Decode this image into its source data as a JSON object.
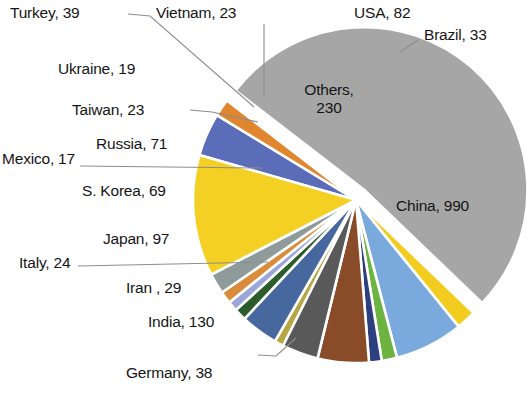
{
  "chart_data": {
    "type": "pie",
    "title": "",
    "subtitle": "",
    "xlabel": "",
    "ylabel": "",
    "legend_position": "none",
    "grid": false,
    "label_format": "name, value",
    "total": 1801,
    "exploded_slices": [
      "China"
    ],
    "categories": [
      "USA",
      "Brazil",
      "China",
      "Germany",
      "India",
      "Iran ",
      "Italy",
      "Japan",
      "S. Korea",
      "Mexico",
      "Russia",
      "Taiwan",
      "Ukraine",
      "Vietnam",
      "Turkey",
      "Others"
    ],
    "values": [
      82,
      33,
      990,
      38,
      130,
      29,
      24,
      97,
      69,
      17,
      71,
      23,
      19,
      23,
      39,
      230
    ],
    "colors": [
      "#5b6cb8",
      "#e0862e",
      "#a6a6a6",
      "#f2cd20",
      "#7aa9dd",
      "#6cb33f",
      "#2e3f7f",
      "#8a4b28",
      "#595959",
      "#b5a642",
      "#46689e",
      "#2c5b2c",
      "#9aa7d8",
      "#d98c3a",
      "#8f9b9b",
      "#f5d024"
    ],
    "slices": [
      {
        "name": "USA",
        "value": 82,
        "color": "#5b6cb8",
        "label": "USA, 82",
        "label_placement": "outside"
      },
      {
        "name": "Brazil",
        "value": 33,
        "color": "#e0862e",
        "label": "Brazil, 33",
        "label_placement": "outside-leader"
      },
      {
        "name": "China",
        "value": 990,
        "color": "#a6a6a6",
        "label": "China, 990",
        "label_placement": "inside",
        "exploded": true
      },
      {
        "name": "Germany",
        "value": 38,
        "color": "#f2cd20",
        "label": "Germany, 38",
        "label_placement": "outside-leader"
      },
      {
        "name": "India",
        "value": 130,
        "color": "#7aa9dd",
        "label": "India, 130",
        "label_placement": "outside"
      },
      {
        "name": "Iran ",
        "value": 29,
        "color": "#6cb33f",
        "label": "Iran , 29",
        "label_placement": "outside"
      },
      {
        "name": "Italy",
        "value": 24,
        "color": "#2e3f7f",
        "label": "Italy, 24",
        "label_placement": "outside-leader"
      },
      {
        "name": "Japan",
        "value": 97,
        "color": "#8a4b28",
        "label": "Japan, 97",
        "label_placement": "outside"
      },
      {
        "name": "S. Korea",
        "value": 69,
        "color": "#595959",
        "label": "S. Korea, 69",
        "label_placement": "outside"
      },
      {
        "name": "Mexico",
        "value": 17,
        "color": "#b5a642",
        "label": "Mexico, 17",
        "label_placement": "outside-leader"
      },
      {
        "name": "Russia",
        "value": 71,
        "color": "#46689e",
        "label": "Russia, 71",
        "label_placement": "outside"
      },
      {
        "name": "Taiwan",
        "value": 23,
        "color": "#2c5b2c",
        "label": "Taiwan, 23",
        "label_placement": "outside-leader"
      },
      {
        "name": "Ukraine",
        "value": 19,
        "color": "#9aa7d8",
        "label": "Ukraine, 19",
        "label_placement": "outside"
      },
      {
        "name": "Vietnam",
        "value": 23,
        "color": "#d98c3a",
        "label": "Vietnam, 23",
        "label_placement": "outside-leader"
      },
      {
        "name": "Turkey",
        "value": 39,
        "color": "#8f9b9b",
        "label": "Turkey, 39",
        "label_placement": "outside-leader"
      },
      {
        "name": "Others",
        "value": 230,
        "color": "#f5d024",
        "label": "Others,\n230",
        "label_placement": "inside"
      }
    ]
  },
  "labels": {
    "turkey": "Turkey, 39",
    "vietnam": "Vietnam, 23",
    "ukraine": "Ukraine, 19",
    "taiwan": "Taiwan, 23",
    "russia": "Russia, 71",
    "mexico": "Mexico, 17",
    "skorea": "S. Korea, 69",
    "japan": "Japan, 97",
    "italy": "Italy, 24",
    "iran": "Iran , 29",
    "india": "India, 130",
    "germany": "Germany, 38",
    "usa": "USA, 82",
    "brazil": "Brazil, 33",
    "china": "China, 990",
    "others_line1": "Others,",
    "others_line2": "230"
  }
}
